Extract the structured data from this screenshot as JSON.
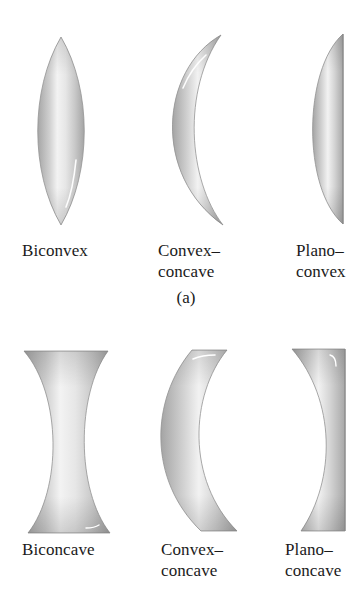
{
  "figure": {
    "panel_a": {
      "caption": "(a)",
      "lenses": [
        {
          "id": "biconvex",
          "label_lines": [
            "Biconvex"
          ],
          "type": "converging"
        },
        {
          "id": "convex-concave-a",
          "label_lines": [
            "Convex–",
            "concave"
          ],
          "type": "converging"
        },
        {
          "id": "plano-convex",
          "label_lines": [
            "Plano–",
            "convex"
          ],
          "type": "converging"
        }
      ]
    },
    "panel_b": {
      "lenses": [
        {
          "id": "biconcave",
          "label_lines": [
            "Biconcave"
          ],
          "type": "diverging"
        },
        {
          "id": "convex-concave-b",
          "label_lines": [
            "Convex–",
            "concave"
          ],
          "type": "diverging"
        },
        {
          "id": "plano-concave",
          "label_lines": [
            "Plano–",
            "concave"
          ],
          "type": "diverging"
        }
      ]
    },
    "colors": {
      "lens_edge": "#a6a6a6",
      "lens_mid": "#c9c9c9",
      "lens_highlight": "#f4f4f4",
      "outline": "#8f8f8f",
      "text": "#1a1a1a",
      "background": "#ffffff"
    }
  }
}
